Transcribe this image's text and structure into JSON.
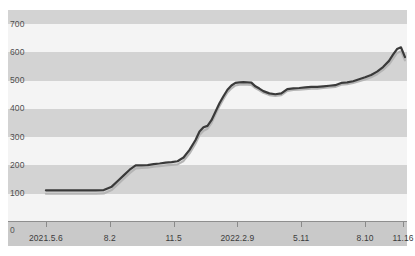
{
  "chart_data": {
    "type": "line",
    "title": "",
    "subtitle": "",
    "xlabel": "",
    "ylabel": "",
    "ylim": [
      0,
      750
    ],
    "xlim": [
      0,
      100
    ],
    "grid": "horizontal-bands",
    "legend_position": "none",
    "y_ticks": [
      0,
      100,
      200,
      300,
      400,
      500,
      600,
      700
    ],
    "y_tick_labels": [
      "0",
      "100",
      "200",
      "300",
      "400",
      "500",
      "600",
      "700"
    ],
    "x_tick_labels": [
      "2021.5.6",
      "8.2",
      "11.5",
      "2022.2.9",
      "5.11",
      "8.10",
      "11.16"
    ],
    "x_tick_positions": [
      9.5,
      25.5,
      41.5,
      57.5,
      73.5,
      89.5,
      99.0
    ],
    "series": [
      {
        "name": "primary",
        "color": "#3a3a3a",
        "x": [
          9.5,
          12.0,
          14.5,
          17.0,
          19.5,
          22.0,
          24.0,
          26.0,
          27.5,
          29.0,
          30.5,
          32.0,
          33.5,
          35.0,
          36.5,
          38.0,
          39.5,
          41.0,
          42.5,
          44.0,
          45.5,
          47.0,
          48.0,
          49.0,
          50.0,
          51.0,
          52.0,
          53.0,
          54.0,
          55.0,
          56.0,
          57.0,
          58.0,
          59.0,
          60.0,
          61.0,
          62.0,
          63.0,
          64.0,
          65.5,
          67.0,
          68.5,
          70.0,
          71.5,
          73.0,
          74.5,
          76.0,
          77.5,
          79.0,
          80.5,
          82.0,
          83.5,
          85.0,
          86.5,
          88.0,
          89.5,
          91.0,
          92.5,
          94.0,
          95.5,
          96.5,
          97.5,
          98.5,
          99.5
        ],
        "values": [
          112,
          112,
          112,
          112,
          112,
          112,
          113,
          125,
          145,
          165,
          185,
          200,
          200,
          201,
          205,
          207,
          210,
          212,
          215,
          228,
          255,
          290,
          320,
          335,
          340,
          360,
          390,
          420,
          445,
          468,
          483,
          492,
          494,
          495,
          494,
          493,
          480,
          472,
          463,
          455,
          452,
          455,
          470,
          473,
          474,
          476,
          478,
          478,
          480,
          482,
          484,
          492,
          494,
          498,
          505,
          512,
          520,
          532,
          548,
          570,
          592,
          612,
          618,
          583
        ]
      },
      {
        "name": "secondary",
        "color": "#b5b5b5",
        "x": [
          9.5,
          12.0,
          14.5,
          17.0,
          19.5,
          22.0,
          24.0,
          26.0,
          27.5,
          29.0,
          30.5,
          32.0,
          33.5,
          35.0,
          36.5,
          38.0,
          39.5,
          41.0,
          42.5,
          44.0,
          45.5,
          47.0,
          48.0,
          49.0,
          50.0,
          51.0,
          52.0,
          53.0,
          54.0,
          55.0,
          56.0,
          57.0,
          58.0,
          59.0,
          60.0,
          61.0,
          62.0,
          63.0,
          64.0,
          65.5,
          67.0,
          68.5,
          70.0,
          71.5,
          73.0,
          74.5,
          76.0,
          77.5,
          79.0,
          80.5,
          82.0,
          83.5,
          85.0,
          86.5,
          88.0,
          89.5,
          91.0,
          92.5,
          94.0,
          95.5,
          96.5,
          97.5,
          98.5,
          99.5
        ],
        "values": [
          100,
          100,
          100,
          100,
          100,
          100,
          101,
          113,
          133,
          153,
          173,
          190,
          191,
          192,
          196,
          198,
          200,
          202,
          204,
          216,
          243,
          278,
          308,
          323,
          330,
          350,
          380,
          410,
          435,
          458,
          473,
          483,
          486,
          487,
          486,
          485,
          474,
          466,
          457,
          449,
          446,
          449,
          464,
          467,
          468,
          470,
          472,
          472,
          474,
          476,
          478,
          486,
          488,
          492,
          498,
          504,
          512,
          523,
          538,
          558,
          578,
          598,
          604,
          572
        ]
      }
    ]
  },
  "axis": {
    "zero_label": "0"
  }
}
